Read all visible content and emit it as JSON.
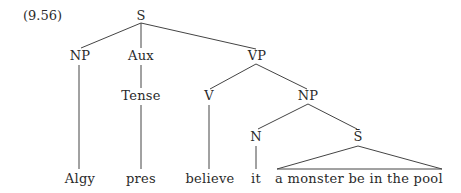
{
  "example_number": "(9.56)",
  "nodes": {
    "S": "S",
    "NP1": "NP",
    "Aux": "Aux",
    "VP": "VP",
    "Tense": "Tense",
    "V": "V",
    "NP2": "NP",
    "N": "N",
    "Sbar": "S̄"
  },
  "leaves": {
    "algy": "Algy",
    "pres": "pres",
    "believe": "believe",
    "it": "it",
    "clause": "a monster be in the pool"
  }
}
